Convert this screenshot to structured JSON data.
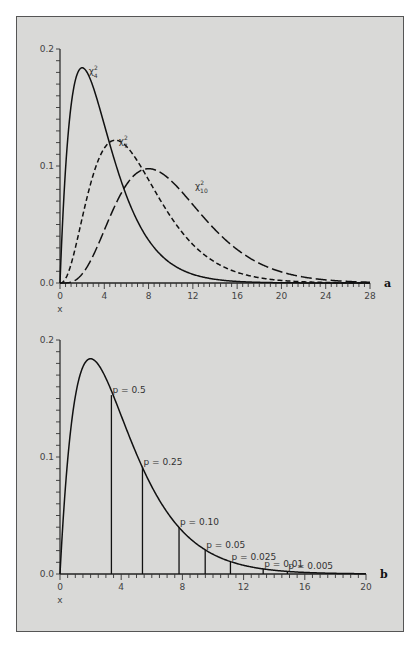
{
  "chart_data": [
    {
      "id": "a",
      "type": "line",
      "panel_label": "a",
      "title": "",
      "xlabel": "x",
      "ylabel": "",
      "xlim": [
        0,
        28
      ],
      "ylim": [
        0.0,
        0.2
      ],
      "x_ticks": [
        0,
        4,
        8,
        12,
        16,
        20,
        24,
        28
      ],
      "x_tick_labels": [
        "0",
        "4",
        "8",
        "12",
        "16",
        "20",
        "24",
        "28"
      ],
      "y_ticks": [
        0.0,
        0.1,
        0.2
      ],
      "y_tick_labels": [
        "0.0",
        "0.1",
        "0.2"
      ],
      "minor_x_step": 0.5,
      "minor_y_step": 0.01,
      "grid": false,
      "series": [
        {
          "name": "χ²₄",
          "label_main": "χ",
          "label_sup": "2",
          "label_sub": "4",
          "df": 4,
          "style": "solid",
          "peak": {
            "x": 2,
            "y": 0.184
          },
          "label_pos": {
            "x": 2.6,
            "y": 0.182
          }
        },
        {
          "name": "χ²₇",
          "label_main": "χ",
          "label_sup": "2",
          "label_sub": "7",
          "df": 7,
          "style": "dashed",
          "peak": {
            "x": 5,
            "y": 0.12
          },
          "label_pos": {
            "x": 5.3,
            "y": 0.122
          }
        },
        {
          "name": "χ²₁₀",
          "label_main": "χ",
          "label_sup": "2",
          "label_sub": "10",
          "df": 10,
          "style": "long-dashed",
          "peak": {
            "x": 8,
            "y": 0.098
          },
          "label_pos": {
            "x": 12.2,
            "y": 0.084
          }
        }
      ]
    },
    {
      "id": "b",
      "type": "line",
      "panel_label": "b",
      "title": "",
      "xlabel": "x",
      "ylabel": "",
      "xlim": [
        0,
        20
      ],
      "ylim": [
        0.0,
        0.2
      ],
      "x_ticks": [
        0,
        4,
        8,
        12,
        16,
        20
      ],
      "x_tick_labels": [
        "0",
        "4",
        "8",
        "12",
        "16",
        "20"
      ],
      "y_ticks": [
        0.0,
        0.1,
        0.2
      ],
      "y_tick_labels": [
        "0.0",
        "0.1",
        "0.2"
      ],
      "minor_x_step": 0.5,
      "minor_y_step": 0.01,
      "grid": false,
      "series": [
        {
          "name": "χ²₄",
          "df": 4,
          "style": "solid",
          "peak": {
            "x": 2,
            "y": 0.184
          }
        }
      ],
      "annotations": [
        {
          "label": "p = 0.5",
          "x": 3.36,
          "y": 0.1529
        },
        {
          "label": "p = 0.25",
          "x": 5.39,
          "y": 0.0912
        },
        {
          "label": "p = 0.10",
          "x": 7.78,
          "y": 0.0398
        },
        {
          "label": "p = 0.05",
          "x": 9.49,
          "y": 0.0206
        },
        {
          "label": "p = 0.025",
          "x": 11.14,
          "y": 0.0106
        },
        {
          "label": "p = 0.01",
          "x": 13.28,
          "y": 0.0043
        },
        {
          "label": "p = 0.005",
          "x": 14.86,
          "y": 0.0022
        }
      ]
    }
  ],
  "colors": {
    "background": "#d9d9d7",
    "ink": "#111111",
    "frame": "#555555"
  }
}
